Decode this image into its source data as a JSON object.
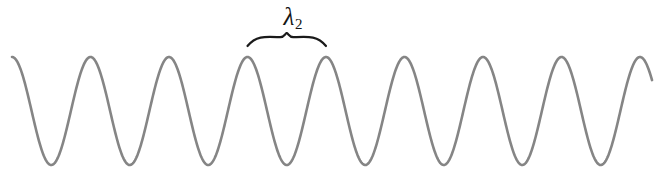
{
  "figure": {
    "type": "wave-diagram",
    "width": 655,
    "height": 179,
    "background_color": "#ffffff"
  },
  "wave": {
    "name": "sinusoidal-wave",
    "color": "#858585",
    "stroke_width": 2.6,
    "crest_y": 57,
    "trough_y": 165,
    "baseline_y": 111,
    "amplitude": 54,
    "wavelength_px": 78.5,
    "crest_x_positions": [
      12,
      90.5,
      169,
      247.5,
      326,
      404.5,
      483,
      561.5,
      640
    ],
    "crest_count": 9,
    "x_start": 12,
    "x_end": 652
  },
  "annotation": {
    "brace": {
      "name": "wavelength-brace",
      "color": "#1a1a1a",
      "stroke_width": 2.2,
      "x_left": 247.5,
      "x_right": 326,
      "y_tip": 33,
      "y_base": 46,
      "center_x": 286.75
    },
    "label": {
      "name": "wavelength-label",
      "symbol": "λ",
      "subscript": "2",
      "text": "λ2",
      "color": "#151515",
      "center_x": 293,
      "top_y": 4
    }
  },
  "chart_data": {
    "type": "line",
    "title": "",
    "xlabel": "",
    "ylabel": "",
    "grid": false,
    "legend": null,
    "annotations": [
      {
        "text": "λ2",
        "kind": "brace-span",
        "spans_x": [
          247.5,
          326
        ],
        "meaning": "wavelength"
      }
    ],
    "series": [
      {
        "name": "wave",
        "form": "cosine",
        "color": "#858585",
        "amplitude": 54,
        "wavelength": 78.5,
        "phase_peak_x": 12,
        "baseline": 111,
        "x_range": [
          12,
          652
        ]
      }
    ]
  }
}
